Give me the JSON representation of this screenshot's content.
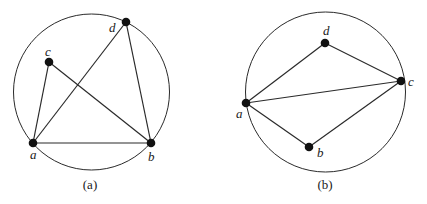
{
  "figures": [
    {
      "id": "a",
      "caption": "(a)",
      "circle": {
        "cx": 91.5,
        "cy": 92,
        "r": 78
      },
      "nodes": [
        {
          "name": "a",
          "x": 33,
          "y": 143,
          "lx": 30,
          "ly": 159
        },
        {
          "name": "b",
          "x": 151,
          "y": 143,
          "lx": 148,
          "ly": 161
        },
        {
          "name": "c",
          "x": 49,
          "y": 62,
          "lx": 45,
          "ly": 56
        },
        {
          "name": "d",
          "x": 126,
          "y": 22,
          "lx": 109,
          "ly": 32
        }
      ],
      "edges": [
        [
          "a",
          "b"
        ],
        [
          "a",
          "c"
        ],
        [
          "a",
          "d"
        ],
        [
          "c",
          "b"
        ],
        [
          "d",
          "b"
        ]
      ]
    },
    {
      "id": "b",
      "caption": "(b)",
      "circle": {
        "cx": 325.5,
        "cy": 92,
        "r": 80
      },
      "nodes": [
        {
          "name": "a",
          "x": 246,
          "y": 103,
          "lx": 236,
          "ly": 118
        },
        {
          "name": "b",
          "x": 309,
          "y": 147,
          "lx": 317,
          "ly": 157
        },
        {
          "name": "c",
          "x": 401,
          "y": 81,
          "lx": 408,
          "ly": 86
        },
        {
          "name": "d",
          "x": 325,
          "y": 43,
          "lx": 323,
          "ly": 35
        }
      ],
      "edges": [
        [
          "a",
          "d"
        ],
        [
          "d",
          "c"
        ],
        [
          "a",
          "c"
        ],
        [
          "a",
          "b"
        ],
        [
          "b",
          "c"
        ]
      ]
    }
  ],
  "captions": {
    "left": "(a)",
    "right": "(b)"
  }
}
